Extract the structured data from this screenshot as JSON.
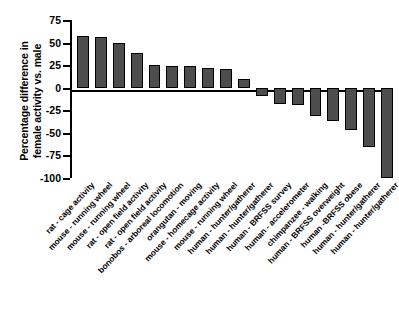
{
  "chart_data": {
    "type": "bar",
    "title": "",
    "xlabel": "",
    "ylabel": "Percentage difference in\nfemale activity vs. male",
    "ylim": [
      -100,
      75
    ],
    "yticks": [
      75,
      50,
      25,
      0,
      -25,
      -50,
      -75,
      -100
    ],
    "ytick_labels": [
      "75",
      "50",
      "25",
      "0",
      "-25",
      "-50",
      "-75",
      "-100"
    ],
    "grid": false,
    "legend": "none",
    "bar_color": "#4d4d4d",
    "bar_edge_color": "#000000",
    "categories": [
      "rat - cage activity",
      "mouse - running wheel",
      "mouse - running wheel",
      "rat - open field activity",
      "rat - open field activity",
      "bonobos - arboreal locomotion",
      "orangutan - moving",
      "mouse - homecage activity",
      "mouse - running wheel",
      "human - hunter/gatherer",
      "human - hunter/gatherer",
      "human - BRFSS survey",
      "human - accelerometer",
      "chimpanzee - walking",
      "human - BRFSS overweight",
      "human -BRFSS obese",
      "human - hunter/gatherer",
      "human - hunter/gatherer"
    ],
    "values": [
      57,
      56,
      49,
      39,
      25,
      24,
      24,
      22,
      21,
      10,
      -9,
      -18,
      -19,
      -31,
      -37,
      -47,
      -66,
      -100
    ]
  },
  "caption": {
    "text": ""
  }
}
